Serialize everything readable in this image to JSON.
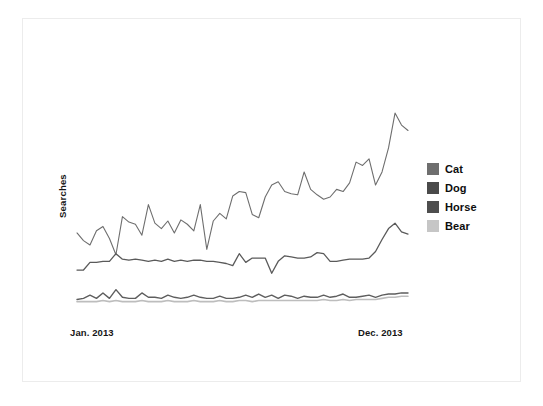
{
  "chart_data": {
    "type": "line",
    "title": "",
    "subtitle": "",
    "xlabel": "",
    "ylabel": "Searches",
    "grid": false,
    "legend_position": "right",
    "xlim": [
      0,
      51
    ],
    "ylim": [
      0,
      100
    ],
    "x_tick_labels": [
      "Jan. 2013",
      "Dec. 2013"
    ],
    "x_tick_positions": [
      0,
      51
    ],
    "y_tick_labels": [],
    "annotations": [],
    "axis_note": "y-axis is unlabeled (no numeric ticks); values below are read off pixel positions and normalized 0-100 where 100 is the top of the drawn plot region",
    "series": [
      {
        "name": "Cat",
        "color": "#6e6e6e",
        "linewidth": 1.1,
        "values": [
          39.0,
          35.5,
          33.5,
          40.0,
          42.0,
          36.5,
          29.0,
          46.5,
          44.0,
          43.0,
          38.0,
          52.0,
          43.5,
          41.0,
          44.5,
          39.0,
          45.0,
          43.0,
          40.0,
          52.0,
          31.5,
          44.5,
          48.0,
          45.5,
          56.0,
          58.0,
          57.5,
          47.5,
          46.0,
          55.5,
          61.0,
          62.5,
          58.0,
          57.0,
          56.5,
          67.0,
          59.0,
          56.5,
          54.5,
          55.5,
          59.0,
          58.0,
          62.0,
          71.5,
          70.0,
          73.0,
          61.0,
          67.0,
          78.0,
          94.0,
          88.5,
          86.0
        ]
      },
      {
        "name": "Dog",
        "color": "#5a5a5a",
        "linewidth": 1.3,
        "values": [
          22.0,
          22.0,
          25.5,
          25.5,
          26.0,
          26.0,
          29.5,
          27.0,
          26.5,
          27.0,
          26.5,
          26.0,
          26.5,
          26.0,
          27.0,
          26.0,
          26.5,
          26.0,
          26.5,
          26.5,
          26.0,
          26.0,
          25.5,
          25.0,
          24.0,
          29.5,
          25.5,
          27.5,
          27.5,
          27.5,
          20.5,
          26.0,
          28.5,
          28.0,
          27.5,
          27.5,
          28.0,
          30.0,
          29.5,
          26.0,
          26.0,
          26.5,
          27.0,
          27.0,
          27.0,
          27.5,
          30.5,
          36.0,
          41.0,
          43.5,
          39.5,
          38.5
        ]
      },
      {
        "name": "Horse",
        "color": "#5e5e5e",
        "linewidth": 1.4,
        "values": [
          8.5,
          9.0,
          10.5,
          9.0,
          11.5,
          9.0,
          13.0,
          9.5,
          9.0,
          9.0,
          11.5,
          9.5,
          9.5,
          9.0,
          10.5,
          9.5,
          9.0,
          9.5,
          10.5,
          9.5,
          9.0,
          9.0,
          10.0,
          9.0,
          9.0,
          9.5,
          10.5,
          9.5,
          11.0,
          9.5,
          10.5,
          9.0,
          10.5,
          10.0,
          9.0,
          10.0,
          9.5,
          9.5,
          10.5,
          9.5,
          10.0,
          11.0,
          9.5,
          9.5,
          10.0,
          10.5,
          9.5,
          10.5,
          11.0,
          11.0,
          11.5,
          11.5
        ]
      },
      {
        "name": "Bear",
        "color": "#bdbdbd",
        "linewidth": 1.6,
        "values": [
          7.5,
          7.5,
          7.5,
          7.5,
          8.0,
          7.5,
          8.0,
          7.5,
          7.5,
          7.5,
          8.0,
          7.5,
          7.5,
          7.5,
          8.0,
          7.5,
          7.5,
          7.5,
          8.0,
          7.5,
          7.5,
          7.5,
          8.0,
          7.5,
          7.5,
          8.0,
          8.0,
          7.5,
          8.0,
          8.0,
          8.0,
          8.0,
          8.0,
          8.0,
          8.0,
          8.0,
          8.0,
          8.0,
          8.5,
          8.0,
          8.0,
          8.5,
          8.0,
          8.5,
          8.5,
          8.5,
          8.5,
          9.0,
          9.5,
          9.5,
          10.0,
          10.0
        ]
      }
    ]
  },
  "axes": {
    "y_label": "Searches",
    "x_start_label": "Jan. 2013",
    "x_end_label": "Dec. 2013"
  },
  "legend": {
    "entries": [
      {
        "label": "Cat",
        "color": "#6e6e6e"
      },
      {
        "label": "Dog",
        "color": "#4a4a4a"
      },
      {
        "label": "Horse",
        "color": "#4e4e4e"
      },
      {
        "label": "Bear",
        "color": "#c6c6c6"
      }
    ]
  },
  "colors": {
    "background": "#ffffff",
    "frame_border": "#ececec",
    "text": "#161616"
  }
}
